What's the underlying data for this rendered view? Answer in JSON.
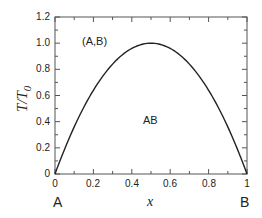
{
  "chart_data": {
    "type": "line",
    "title": "",
    "xlabel": "x",
    "ylabel": "T/T0",
    "xlim": [
      0,
      1
    ],
    "ylim": [
      0,
      1.2
    ],
    "x_ticks": [
      "0",
      "0.2",
      "0.4",
      "0.6",
      "0.8",
      "1"
    ],
    "y_ticks": [
      "0",
      "0.2",
      "0.4",
      "0.6",
      "0.8",
      "1.0",
      "1.2"
    ],
    "grid": false,
    "legend": null,
    "series": [
      {
        "name": "phase boundary",
        "x": [
          0,
          0.05,
          0.1,
          0.15,
          0.2,
          0.25,
          0.3,
          0.35,
          0.4,
          0.45,
          0.5,
          0.55,
          0.6,
          0.65,
          0.7,
          0.75,
          0.8,
          0.85,
          0.9,
          0.95,
          1.0
        ],
        "values": [
          0,
          0.19,
          0.36,
          0.51,
          0.64,
          0.75,
          0.84,
          0.91,
          0.96,
          0.99,
          1.0,
          0.99,
          0.96,
          0.91,
          0.84,
          0.75,
          0.64,
          0.51,
          0.36,
          0.19,
          0
        ],
        "color": "#222222"
      }
    ],
    "annotations": [
      {
        "text": "(A,B)",
        "x": 0.15,
        "y": 1.0
      },
      {
        "text": "AB",
        "x": 0.5,
        "y": 0.5
      },
      {
        "text": "A",
        "x": 0.0,
        "y": -0.25
      },
      {
        "text": "B",
        "x": 1.0,
        "y": -0.25
      }
    ]
  },
  "labels": {
    "ylabel_main": "T/T",
    "ylabel_sub": "0",
    "xlabel": "x",
    "region_upper": "(A,B)",
    "region_lower": "AB",
    "corner_left": "A",
    "corner_right": "B"
  },
  "ticks": {
    "x": [
      "0",
      "0.2",
      "0.4",
      "0.6",
      "0.8",
      "1"
    ],
    "y": [
      "0",
      "0.2",
      "0.4",
      "0.6",
      "0.8",
      "1.0",
      "1.2"
    ]
  }
}
